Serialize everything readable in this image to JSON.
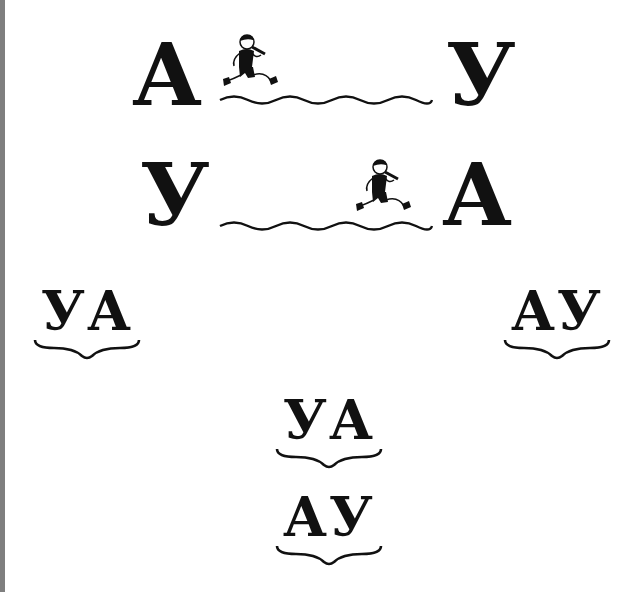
{
  "rows": [
    {
      "start_letter": "А",
      "end_letter": "У",
      "runner_position": "start",
      "runner_icon": "running-boy-with-flute-icon"
    },
    {
      "start_letter": "У",
      "end_letter": "А",
      "runner_position": "end",
      "runner_icon": "running-boy-with-flute-icon"
    }
  ],
  "syllables": {
    "left": "УА",
    "right": "АУ",
    "center_top": "УА",
    "center_bottom": "АУ"
  },
  "colors": {
    "ink": "#111111",
    "left_stripe": "#7f7f7f",
    "background": "#ffffff"
  }
}
